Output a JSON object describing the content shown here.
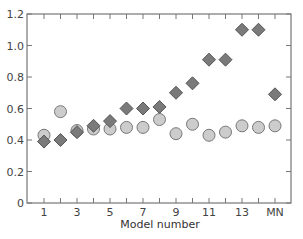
{
  "chart_data": {
    "type": "scatter",
    "title": "",
    "xlabel": "Model number",
    "ylabel": "",
    "categories": [
      "1",
      "2",
      "3",
      "4",
      "5",
      "6",
      "7",
      "8",
      "9",
      "10",
      "11",
      "12",
      "13",
      "14",
      "MN"
    ],
    "x_tick_labels": [
      "1",
      "3",
      "5",
      "7",
      "9",
      "11",
      "13",
      "MN"
    ],
    "y_tick_labels": [
      "0",
      "0.2",
      "0.4",
      "0.6",
      "0.8",
      "1.0",
      "1.2"
    ],
    "ylim": [
      0,
      1.2
    ],
    "grid": false,
    "legend": null,
    "series": [
      {
        "name": "diamonds",
        "marker": "diamond",
        "color": "#7a7a7a",
        "edge_color": "#555555",
        "values": [
          0.39,
          0.4,
          0.45,
          0.49,
          0.52,
          0.6,
          0.6,
          0.61,
          0.7,
          0.76,
          0.91,
          0.91,
          1.1,
          1.1,
          0.69
        ]
      },
      {
        "name": "circles",
        "marker": "circle",
        "color": "#cccccc",
        "edge_color": "#777777",
        "values": [
          0.43,
          0.58,
          0.46,
          0.47,
          0.47,
          0.48,
          0.48,
          0.53,
          0.44,
          0.5,
          0.43,
          0.45,
          0.49,
          0.48,
          0.49
        ]
      }
    ]
  }
}
